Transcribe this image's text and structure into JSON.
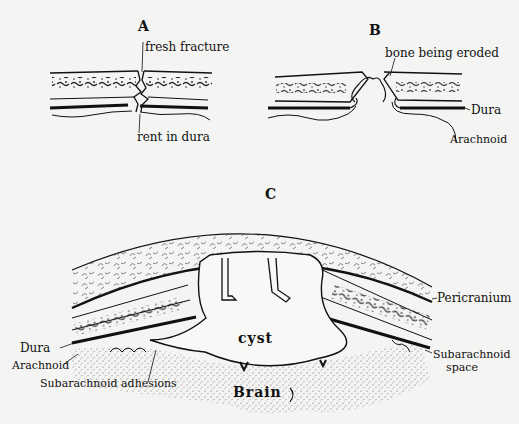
{
  "panels": {
    "A": {
      "letter": "A",
      "labels": {
        "fresh_fracture": "fresh fracture",
        "rent_in_dura": "rent in dura"
      }
    },
    "B": {
      "letter": "B",
      "labels": {
        "bone_being_eroded": "bone being eroded",
        "dura": "Dura",
        "arachnoid": "Arachnoid"
      }
    },
    "C": {
      "letter": "C",
      "labels": {
        "cyst": "cyst",
        "brain": "Brain",
        "pericranium": "Pericranium",
        "dura": "Dura",
        "arachnoid": "Arachnoid",
        "subarachnoid_adhesions": "Subarachnoid adhesions",
        "subarachnoid_space_line1": "Subarachnoid",
        "subarachnoid_space_line2": "space"
      }
    }
  },
  "colors": {
    "background": "#f4f4f2",
    "ink": "#111111",
    "stipple": "#555555"
  }
}
